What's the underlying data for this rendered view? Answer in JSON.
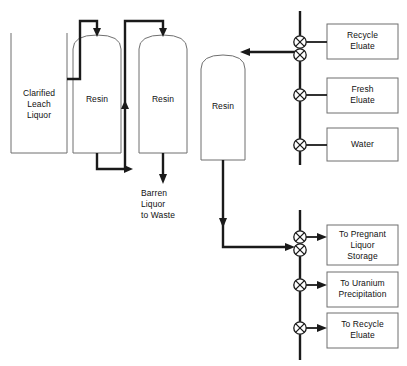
{
  "diagram": {
    "type": "process-flow-diagram",
    "vessels": [
      {
        "id": "feed-tank",
        "label": "Clarified\nLeach\nLiquor",
        "shape": "open-top-rectangle"
      },
      {
        "id": "resin-column-1",
        "label": "Resin",
        "shape": "dome-top-column"
      },
      {
        "id": "resin-column-2",
        "label": "Resin",
        "shape": "dome-top-column"
      },
      {
        "id": "resin-column-3",
        "label": "Resin",
        "shape": "dome-top-column"
      }
    ],
    "stream_labels": [
      {
        "id": "barren-liquor-waste",
        "label": "Barren\nLiquor\nto Waste"
      }
    ],
    "supply_boxes": [
      {
        "id": "recycle-eluate",
        "label": "Recycle\nEluate"
      },
      {
        "id": "fresh-eluate",
        "label": "Fresh\nEluate"
      },
      {
        "id": "water",
        "label": "Water"
      }
    ],
    "destination_boxes": [
      {
        "id": "pregnant-liquor-storage",
        "label": "To Pregnant\nLiquor\nStorage"
      },
      {
        "id": "uranium-precipitation",
        "label": "To Uranium\nPrecipitation"
      },
      {
        "id": "recycle-eluate-return",
        "label": "To Recycle\nEluate"
      }
    ],
    "valves": [
      {
        "id": "valve-recycle-eluate",
        "symbol": "crossed-circle",
        "branch": "recycle-eluate"
      },
      {
        "id": "valve-header-top",
        "symbol": "crossed-circle",
        "branch": "resin-column-3-inlet"
      },
      {
        "id": "valve-fresh-eluate",
        "symbol": "crossed-circle",
        "branch": "fresh-eluate"
      },
      {
        "id": "valve-water",
        "symbol": "crossed-circle",
        "branch": "water"
      },
      {
        "id": "valve-pregnant-liquor",
        "symbol": "crossed-circle",
        "branch": "pregnant-liquor-storage"
      },
      {
        "id": "valve-header-bottom",
        "symbol": "crossed-circle",
        "branch": "resin-column-3-outlet"
      },
      {
        "id": "valve-uranium-precipitation",
        "symbol": "crossed-circle",
        "branch": "uranium-precipitation"
      },
      {
        "id": "valve-recycle-return",
        "symbol": "crossed-circle",
        "branch": "recycle-eluate-return"
      }
    ],
    "colors": {
      "background": "#ffffff",
      "pipe": "#1a1a1a",
      "outline": "#6f6f6f",
      "text": "#111111"
    }
  }
}
